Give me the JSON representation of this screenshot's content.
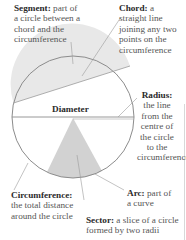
{
  "colors": {
    "circle_stroke": "#8c8c8c",
    "segment_fill": "#e6e6e6",
    "sector_fill": "#cfcfcf",
    "leader_line": "#8c8c8c",
    "label_bold": "#2a2a2a",
    "label_text": "#555555"
  },
  "circle": {
    "cx": 73,
    "cy": 117,
    "r": 61
  },
  "labels": {
    "segment": {
      "term": "Segment:",
      "lines": [
        "part of",
        "a circle between a",
        "chord and the",
        "circumference"
      ]
    },
    "chord": {
      "term": "Chord:",
      "lines": [
        "a",
        "straight line",
        "joining any two",
        "points on the",
        "circumference"
      ]
    },
    "diameter": {
      "term": "Diameter"
    },
    "radius": {
      "term": "Radius:",
      "lines": [
        "the line",
        "from the",
        "centre of",
        "the circle",
        "to the",
        "circumference"
      ]
    },
    "arc": {
      "term": "Arc:",
      "lines": [
        "part of",
        "a curve"
      ]
    },
    "circumference": {
      "term": "Circumference:",
      "lines": [
        "the total distance",
        "around the circle"
      ]
    },
    "sector": {
      "term": "Sector:",
      "lines": [
        "a slice of a circle",
        "formed by two radii"
      ]
    }
  }
}
